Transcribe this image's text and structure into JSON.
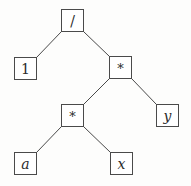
{
  "diagram": {
    "type": "expression-tree",
    "colors": {
      "line": "#4a4a4a",
      "text": "#2a2a2a",
      "background": "#fdfdfc"
    },
    "nodes": [
      {
        "id": "root",
        "label": "/",
        "kind": "operator",
        "x": 61,
        "y": 9
      },
      {
        "id": "one",
        "label": "1",
        "kind": "constant",
        "x": 14,
        "y": 57
      },
      {
        "id": "mul1",
        "label": "*",
        "kind": "operator",
        "x": 109,
        "y": 56
      },
      {
        "id": "y",
        "label": "y",
        "kind": "variable",
        "x": 156,
        "y": 104
      },
      {
        "id": "mul2",
        "label": "*",
        "kind": "operator",
        "x": 61,
        "y": 104
      },
      {
        "id": "a",
        "label": "a",
        "kind": "variable",
        "x": 14,
        "y": 152
      },
      {
        "id": "x",
        "label": "x",
        "kind": "variable",
        "x": 110,
        "y": 152
      }
    ],
    "edges": [
      {
        "from": "root",
        "to": "one"
      },
      {
        "from": "root",
        "to": "mul1"
      },
      {
        "from": "mul1",
        "to": "mul2"
      },
      {
        "from": "mul1",
        "to": "y"
      },
      {
        "from": "mul2",
        "to": "a"
      },
      {
        "from": "mul2",
        "to": "x"
      }
    ]
  }
}
